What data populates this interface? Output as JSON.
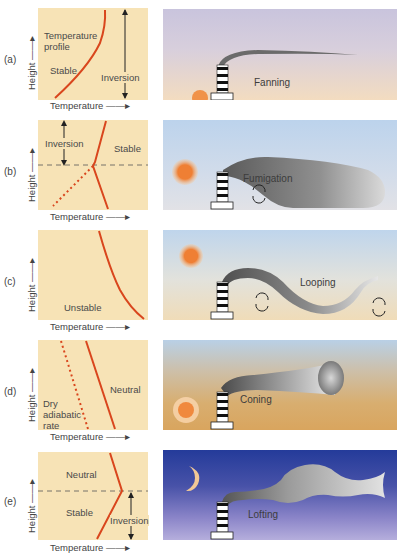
{
  "axis": {
    "x_label": "Temperature",
    "y_label": "Height"
  },
  "colors": {
    "graph_bg": "#f7e3b6",
    "profile_line": "#d9461d",
    "plume_dark": "#5a5a5a",
    "plume_light": "#d6d6d6"
  },
  "panels": [
    {
      "letter": "(a)",
      "graph_labels": [
        "Temperature profile",
        "Stable",
        "Inversion"
      ],
      "plume_type": "Fanning",
      "sky": "evening-purple",
      "light_source": "sun-setting-icon"
    },
    {
      "letter": "(b)",
      "graph_labels": [
        "Inversion",
        "Stable"
      ],
      "plume_type": "Fumigation",
      "sky": "morning-blue",
      "light_source": "sun-icon"
    },
    {
      "letter": "(c)",
      "graph_labels": [
        "Unstable"
      ],
      "plume_type": "Looping",
      "sky": "day-blue-to-sand",
      "light_source": "sun-icon"
    },
    {
      "letter": "(d)",
      "graph_labels": [
        "Neutral",
        "Dry adiabatic rate"
      ],
      "plume_type": "Coning",
      "sky": "blue-to-brown",
      "light_source": "sun-rays-icon"
    },
    {
      "letter": "(e)",
      "graph_labels": [
        "Neutral",
        "Stable",
        "Inversion"
      ],
      "plume_type": "Lofting",
      "sky": "night-navy",
      "light_source": "moon-icon"
    }
  ],
  "temp_axis_text": "Temperature ——▸",
  "height_axis_text": "Height ——▸",
  "graph_text": {
    "a": {
      "profile_1": "Temperature",
      "profile_2": "profile",
      "stable": "Stable",
      "inversion": "Inversion"
    },
    "b": {
      "inversion": "Inversion",
      "stable": "Stable"
    },
    "c": {
      "unstable": "Unstable"
    },
    "d": {
      "neutral": "Neutral",
      "dry_1": "Dry",
      "dry_2": "adiabatic",
      "dry_3": "rate"
    },
    "e": {
      "neutral": "Neutral",
      "stable": "Stable",
      "inversion": "Inversion"
    }
  }
}
